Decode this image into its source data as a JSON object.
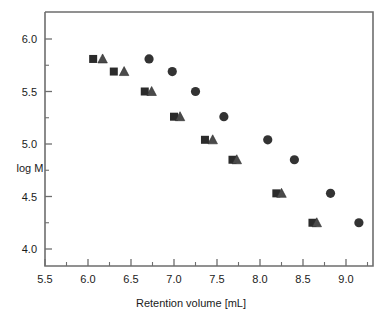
{
  "chart_data": {
    "type": "scatter",
    "title": "",
    "xlabel": "Retention volume [mL]",
    "ylabel": "log M",
    "xlim": [
      5.5,
      9.3
    ],
    "ylim": [
      3.78,
      6.2
    ],
    "xticks": [
      5.5,
      6.0,
      6.5,
      7.0,
      7.5,
      8.0,
      8.5,
      9.0
    ],
    "xticklabels": [
      "5.5",
      "6.0",
      "6.5",
      "7.0",
      "7.5",
      "8.0",
      "8.5",
      "9.0"
    ],
    "yticks": [
      4.0,
      4.5,
      5.0,
      5.5,
      6.0
    ],
    "yticklabels": [
      "4.0",
      "4.5",
      "5.0",
      "5.5",
      "6.0"
    ],
    "x_minor_ticks": [
      5.75,
      6.25,
      6.75,
      7.25,
      7.75,
      8.25,
      8.75,
      9.25
    ],
    "y_minor_ticks": [
      4.25,
      4.75,
      5.25,
      5.75
    ],
    "grid": false,
    "legend": null,
    "series": [
      {
        "name": "square",
        "marker": "square",
        "color": "#2b2b2b",
        "points": [
          {
            "x": 6.06,
            "y": 5.81
          },
          {
            "x": 6.3,
            "y": 5.69
          },
          {
            "x": 6.66,
            "y": 5.5
          },
          {
            "x": 7.0,
            "y": 5.26
          },
          {
            "x": 7.36,
            "y": 5.04
          },
          {
            "x": 7.68,
            "y": 4.85
          },
          {
            "x": 8.19,
            "y": 4.53
          },
          {
            "x": 8.61,
            "y": 4.25
          }
        ]
      },
      {
        "name": "triangle",
        "marker": "triangle",
        "color": "#4a4a4a",
        "points": [
          {
            "x": 6.17,
            "y": 5.81
          },
          {
            "x": 6.42,
            "y": 5.69
          },
          {
            "x": 6.74,
            "y": 5.5
          },
          {
            "x": 7.07,
            "y": 5.26
          },
          {
            "x": 7.45,
            "y": 5.04
          },
          {
            "x": 7.73,
            "y": 4.85
          },
          {
            "x": 8.25,
            "y": 4.53
          },
          {
            "x": 8.66,
            "y": 4.25
          }
        ]
      },
      {
        "name": "circle",
        "marker": "circle",
        "color": "#333333",
        "points": [
          {
            "x": 6.71,
            "y": 5.81
          },
          {
            "x": 6.98,
            "y": 5.69
          },
          {
            "x": 7.25,
            "y": 5.5
          },
          {
            "x": 7.58,
            "y": 5.26
          },
          {
            "x": 8.09,
            "y": 5.04
          },
          {
            "x": 8.4,
            "y": 4.85
          },
          {
            "x": 8.82,
            "y": 4.53
          },
          {
            "x": 9.15,
            "y": 4.25
          }
        ]
      }
    ]
  },
  "axes": {
    "x_title": "Retention volume [mL]",
    "y_title": "log M"
  }
}
